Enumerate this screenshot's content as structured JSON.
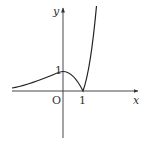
{
  "figure": {
    "type": "function-graph",
    "axes": {
      "x_label": "x",
      "y_label": "y",
      "origin_label": "O",
      "x_tick_label": "1",
      "y_tick_label": "1"
    },
    "curve": {
      "description": "Curve rising from left toward local max at (0,1), decreasing to cusp at (1,0), then rising steeply",
      "key_points": [
        {
          "x": 0,
          "y": 1,
          "label": "local maximum"
        },
        {
          "x": 1,
          "y": 0,
          "label": "cusp minimum"
        }
      ]
    },
    "colors": {
      "stroke": "#222222",
      "axis": "#333333",
      "background": "#ffffff"
    }
  }
}
